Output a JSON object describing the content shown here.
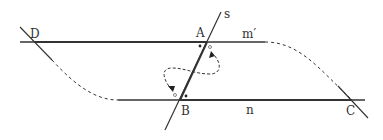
{
  "diagram": {
    "points": {
      "A": {
        "label": "A",
        "x": 207,
        "y": 42
      },
      "B": {
        "label": "B",
        "x": 180,
        "y": 100
      },
      "C": {
        "label": "C",
        "x": 352,
        "y": 100
      },
      "D": {
        "label": "D",
        "x": 35,
        "y": 42
      }
    },
    "lines": {
      "m_prime": {
        "label": "m′"
      },
      "n": {
        "label": "n"
      },
      "s": {
        "label": "s"
      }
    },
    "colors": {
      "stroke": "#333333",
      "background": "#ffffff"
    }
  }
}
